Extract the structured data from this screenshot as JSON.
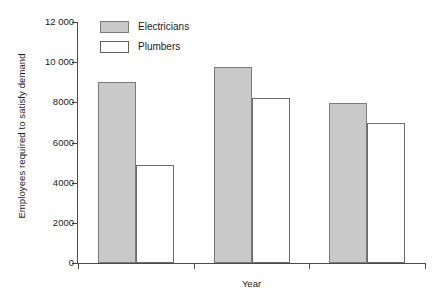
{
  "chart_data": {
    "type": "bar",
    "title": "",
    "subtitle": "",
    "xlabel": "Year",
    "ylabel": "Employees required to satisfy demand",
    "categories": [
      "1997",
      "1999",
      "2001"
    ],
    "series": [
      {
        "name": "Electricians",
        "color": "#c9c9c9",
        "values": [
          9000,
          9750,
          7950
        ]
      },
      {
        "name": "Plumbers",
        "color": "#ffffff",
        "values": [
          4900,
          8200,
          6950
        ]
      }
    ],
    "ylim": [
      0,
      12000
    ],
    "ytick_values": [
      0,
      2000,
      4000,
      6000,
      8000,
      10000,
      12000
    ],
    "ytick_labels": [
      "0",
      "2000",
      "4000",
      "6000",
      "8000",
      "10 000",
      "12 000"
    ],
    "grid": false,
    "legend_position": "top-left",
    "annotations": []
  },
  "legend": {
    "entries": [
      {
        "label": "Electricians",
        "swatch": "filled-gray-swatch"
      },
      {
        "label": "Plumbers",
        "swatch": "outline-white-swatch"
      }
    ]
  },
  "axes": {
    "y_title": "Employees required to satisfy demand",
    "x_title": "Year"
  }
}
